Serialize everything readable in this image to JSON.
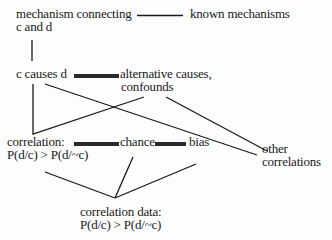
{
  "diagram": {
    "nodes": {
      "mechanism": {
        "line1": "mechanism connecting",
        "line2": "c and d"
      },
      "known_mechanisms": {
        "line1": "known mechanisms"
      },
      "c_causes_d": {
        "line1": "c causes d"
      },
      "alternative_causes": {
        "line1": "alternative causes,",
        "line2": "confounds"
      },
      "correlation": {
        "line1": "correlation:",
        "line2": "P(d/c) > P(d/~c)"
      },
      "chance": {
        "line1": "chance"
      },
      "bias": {
        "line1": "bias"
      },
      "other_correlations": {
        "line1": "other",
        "line2": "correlations"
      },
      "correlation_data": {
        "line1": "correlation data:",
        "line2": "P(d/c) > P(d/~c)"
      }
    },
    "edges": [
      {
        "from": "mechanism",
        "to": "known_mechanisms",
        "style": "thin"
      },
      {
        "from": "mechanism",
        "to": "c_causes_d",
        "style": "thin"
      },
      {
        "from": "c_causes_d",
        "to": "alternative_causes",
        "style": "thick"
      },
      {
        "from": "c_causes_d",
        "to": "correlation",
        "style": "thin"
      },
      {
        "from": "c_causes_d",
        "to": "other_correlations",
        "style": "thin"
      },
      {
        "from": "alternative_causes",
        "to": "correlation",
        "style": "thin"
      },
      {
        "from": "alternative_causes",
        "to": "other_correlations",
        "style": "thin"
      },
      {
        "from": "correlation",
        "to": "chance",
        "style": "thick"
      },
      {
        "from": "chance",
        "to": "bias",
        "style": "thick"
      },
      {
        "from": "correlation",
        "to": "correlation_data",
        "style": "thin"
      },
      {
        "from": "chance",
        "to": "correlation_data",
        "style": "thin"
      },
      {
        "from": "bias",
        "to": "correlation_data",
        "style": "thin"
      }
    ],
    "colors": {
      "ink": "#1a1a1a",
      "thick_bar": "#2a2a2a",
      "background": "#fdfdfd"
    }
  }
}
